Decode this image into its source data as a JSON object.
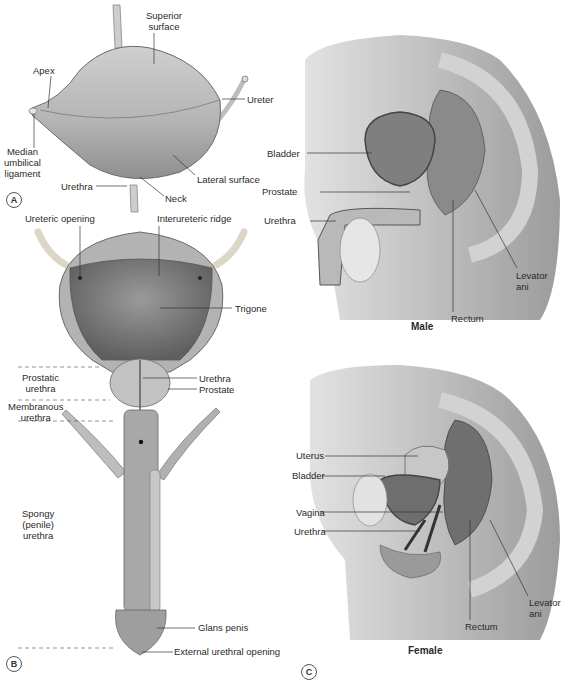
{
  "figure": {
    "panels": {
      "A": {
        "letter": "A",
        "labels": {
          "superior_surface": [
            "Superior",
            "surface"
          ],
          "apex": "Apex",
          "ureter": "Ureter",
          "median_umbilical_ligament": [
            "Median",
            "umbilical",
            "ligament"
          ],
          "lateral_surface": "Lateral surface",
          "urethra": "Urethra",
          "neck": "Neck"
        }
      },
      "B": {
        "letter": "B",
        "labels": {
          "ureteric_opening": "Ureteric opening",
          "interureteric_ridge": "Interureteric ridge",
          "trigone": "Trigone",
          "prostatic_urethra": [
            "Prostatic",
            "urethra"
          ],
          "membranous_urethra": [
            "Membranous",
            "urethra"
          ],
          "urethra": "Urethra",
          "prostate": "Prostate",
          "spongy_urethra": [
            "Spongy",
            "(penile)",
            "urethra"
          ],
          "glans_penis": "Glans penis",
          "external_urethral_opening": "External urethral opening"
        }
      },
      "C": {
        "letter": "C",
        "male": {
          "caption": "Male",
          "labels": {
            "bladder": "Bladder",
            "prostate": "Prostate",
            "urethra": "Urethra",
            "levator_ani": [
              "Levator",
              "ani"
            ],
            "rectum": "Rectum"
          }
        },
        "female": {
          "caption": "Female",
          "labels": {
            "uterus": "Uterus",
            "bladder": "Bladder",
            "vagina": "Vagina",
            "urethra": "Urethra",
            "levator_ani": [
              "Levator",
              "ani"
            ],
            "rectum": "Rectum"
          }
        }
      }
    },
    "colors": {
      "tissue_light": "#d6d6d6",
      "tissue_mid": "#a9a9a9",
      "tissue_dark": "#6e6e6e",
      "line": "#333333"
    }
  }
}
